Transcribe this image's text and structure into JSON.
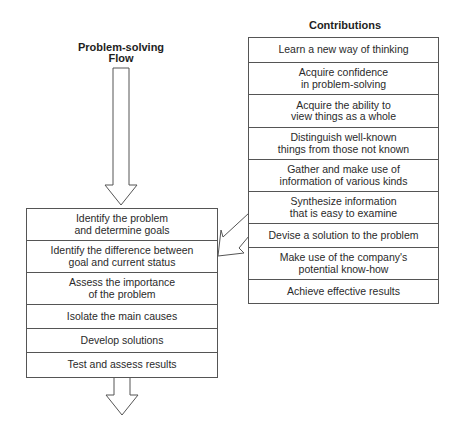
{
  "flow": {
    "title": "Problem-solving\nFlow",
    "steps": [
      "Identify the problem\nand determine goals",
      "Identify the difference between\ngoal and current status",
      "Assess the importance\nof the problem",
      "Isolate the main causes",
      "Develop solutions",
      "Test and assess results"
    ]
  },
  "contributions": {
    "title": "Contributions",
    "items": [
      "Learn a new way of thinking",
      "Acquire confidence\nin problem-solving",
      "Acquire the ability to\nview things as a whole",
      "Distinguish well-known\nthings from those not known",
      "Gather and make use of\ninformation of various kinds",
      "Synthesize information\nthat is easy to examine",
      "Devise a solution to the problem",
      "Make use of the company's\npotential know-how",
      "Achieve effective results"
    ]
  },
  "connectors": {
    "top_arrow": "down-arrow",
    "bottom_arrow": "down-arrow",
    "contribution_arrow": "diagonal-left-arrow"
  },
  "colors": {
    "line": "#555555",
    "text": "#2a2a2a",
    "background": "#ffffff"
  }
}
